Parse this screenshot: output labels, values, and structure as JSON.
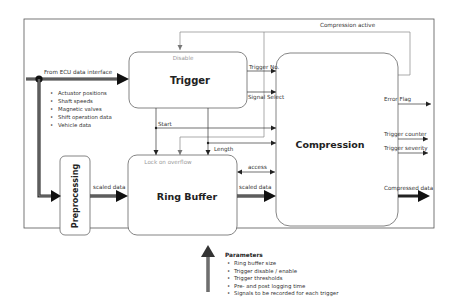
{
  "diagram": {
    "blocks": {
      "trigger": {
        "title": "Trigger",
        "top_label": "Disable"
      },
      "ring_buffer": {
        "title": "Ring Buffer",
        "top_label": "Lock on overflow"
      },
      "compression": {
        "title": "Compression"
      },
      "preprocessing": {
        "title": "Preprocessing"
      }
    },
    "input": {
      "label": "From ECU data interface",
      "items": [
        "Actuator positions",
        "Shaft speeds",
        "Magnetic valves",
        "Shift operation data",
        "Vehicle data"
      ]
    },
    "signals": {
      "compression_active": "Compression active",
      "trigger_no": "Trigger No.",
      "signal_select": "Signal Select",
      "start": "Start",
      "length": "Length",
      "access": "access",
      "scaled_data_pre": "scaled data",
      "scaled_data_rb": "scaled data"
    },
    "outputs": {
      "error_flag": "Error Flag",
      "trigger_counter": "Trigger counter",
      "trigger_severity": "Trigger severity",
      "compressed_data": "Compressed data"
    },
    "parameters": {
      "title": "Parameters",
      "items": [
        "Ring buffer size",
        "Trigger disable / enable",
        "Trigger thresholds",
        "Pre- and post logging time",
        "Signals to be recorded for each trigger"
      ]
    }
  }
}
